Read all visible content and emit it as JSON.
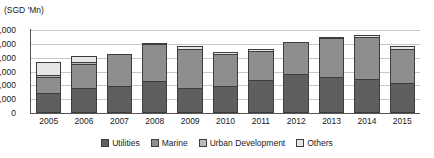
{
  "chart_data": {
    "type": "bar",
    "subtype": "stacked-bar",
    "title": "",
    "unit_label": "(SGD 'Mn)",
    "xlabel": "",
    "ylabel": "",
    "ylim": [
      0,
      12000
    ],
    "ytick_values": [
      0,
      2000,
      4000,
      6000,
      8000,
      10000,
      12000
    ],
    "ytick_labels": [
      "0",
      "2,000",
      "4,000",
      "6,000",
      "8,000",
      "10,000",
      "12,000"
    ],
    "grid": true,
    "grid_axis": "y",
    "legend_position": "bottom",
    "categories": [
      "2005",
      "2006",
      "2007",
      "2008",
      "2009",
      "2010",
      "2011",
      "2012",
      "2013",
      "2014",
      "2015"
    ],
    "series": [
      {
        "name": "Utilities",
        "color": "#5f5f5f",
        "values": [
          2850,
          3600,
          3900,
          4700,
          3650,
          3950,
          4800,
          5650,
          5150,
          4900,
          4300
        ]
      },
      {
        "name": "Marine",
        "color": "#8e8e8e",
        "values": [
          2400,
          3500,
          4700,
          5250,
          5650,
          4550,
          4200,
          4600,
          5650,
          6100,
          5000
        ]
      },
      {
        "name": "Urban Development",
        "color": "#b9b9b9",
        "values": [
          300,
          200,
          0,
          0,
          0,
          0,
          0,
          0,
          0,
          0,
          0
        ]
      },
      {
        "name": "Others",
        "color": "#e6e6e6",
        "values": [
          1800,
          900,
          0,
          200,
          400,
          300,
          100,
          0,
          100,
          100,
          400
        ]
      }
    ],
    "totals": [
      7350,
      8200,
      8600,
      10150,
      9700,
      8800,
      9100,
      10250,
      10900,
      11100,
      9700
    ]
  }
}
